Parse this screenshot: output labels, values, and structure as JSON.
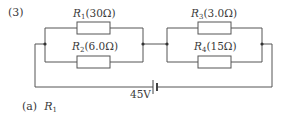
{
  "problem": {
    "number": "(3)",
    "part_label": "(a)",
    "part_var": "R",
    "part_sub": "1"
  },
  "circuit": {
    "battery_label": "45V",
    "resistors": [
      {
        "name": "R",
        "sub": "1",
        "value": "(30Ω)"
      },
      {
        "name": "R",
        "sub": "2",
        "value": "(6.0Ω)"
      },
      {
        "name": "R",
        "sub": "3",
        "value": "(3.0Ω)"
      },
      {
        "name": "R",
        "sub": "4",
        "value": "(15Ω)"
      }
    ],
    "line_color": "#555555"
  }
}
